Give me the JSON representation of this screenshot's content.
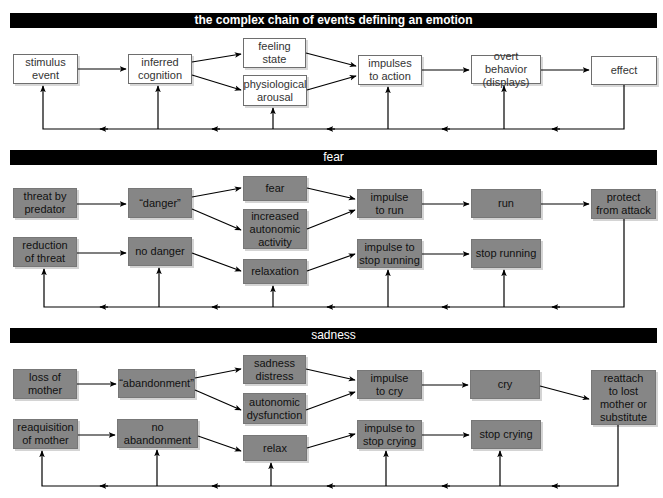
{
  "sections": [
    {
      "title": "the complex chain of events defining an emotion",
      "nodes": {
        "n1": "stimulus\nevent",
        "n2": "inferred\ncognition",
        "n3": "feeling\nstate",
        "n4": "physiological\narousal",
        "n5": "impulses\nto action",
        "n6": "overt behavior\n(displays)",
        "n7": "effect"
      }
    },
    {
      "title": "fear",
      "nodes": {
        "n1": "threat by\npredator",
        "n2": "“danger”",
        "n3": "fear",
        "n4": "increased\nautonomic\nactivity",
        "n5": "impulse\nto run",
        "n6": "run",
        "n7": "protect\nfrom attack",
        "n8": "reduction\nof threat",
        "n9": "no danger",
        "n10": "relaxation",
        "n11": "impulse to\nstop running",
        "n12": "stop running"
      }
    },
    {
      "title": "sadness",
      "nodes": {
        "n1": "loss of\nmother",
        "n2": "“abandonment”",
        "n3": "sadness\ndistress",
        "n4": "autonomic\ndysfunction",
        "n5": "impulse\nto cry",
        "n6": "cry",
        "n7": "reattach\nto lost\nmother or\nsubstitute",
        "n8": "reaquisition\nof mother",
        "n9": "no abandonment",
        "n10": "relax",
        "n11": "impulse to\nstop crying",
        "n12": "stop crying"
      }
    }
  ],
  "colors": {
    "header_bg": "#000000",
    "header_text": "#ffffff",
    "white_box_fill": "#ffffff",
    "gray_box_fill": "#868686",
    "arrow": "#000000"
  }
}
